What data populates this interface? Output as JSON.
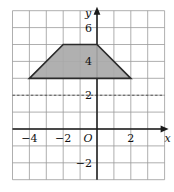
{
  "figure": {
    "title": "",
    "background_color": "#ffffff",
    "grid_color": "#9b9b9b",
    "axis_color": "#1a1a1a",
    "shape_fill_color": "#a9a9a9",
    "shape_stroke_color": "#2b2b2b",
    "dashed_line_color": "#555555"
  },
  "axes": {
    "x_axis_label": "x",
    "y_axis_label": "y",
    "origin_label": "O",
    "x_range": [
      -5,
      4
    ],
    "y_range": [
      -3,
      7
    ],
    "grid_step": 1,
    "grid_visible": true,
    "x_tick_labels": [
      "−4",
      "−2",
      "2"
    ],
    "x_tick_values": [
      -4,
      -2,
      2
    ],
    "y_tick_labels": [
      "6",
      "4",
      "2",
      "−2"
    ],
    "y_tick_values": [
      6,
      4,
      2,
      -2
    ]
  },
  "chart_data": {
    "type": "scatter",
    "title": "",
    "xlabel": "x",
    "ylabel": "y",
    "xlim": [
      -5,
      4
    ],
    "ylim": [
      -3,
      7
    ],
    "grid": true,
    "legend": "none",
    "shapes": [
      {
        "name": "trapezoid",
        "kind": "polygon",
        "fill": "#a9a9a9",
        "stroke": "#2b2b2b",
        "vertices": [
          {
            "x": -4,
            "y": 3
          },
          {
            "x": -2,
            "y": 5
          },
          {
            "x": 0,
            "y": 5
          },
          {
            "x": 2,
            "y": 3
          }
        ]
      }
    ],
    "annotations": [
      {
        "name": "dashed-horizontal-line",
        "kind": "hline",
        "y": 2,
        "style": "dashed",
        "color": "#555555",
        "x_start": -5,
        "x_end": 4
      }
    ]
  }
}
